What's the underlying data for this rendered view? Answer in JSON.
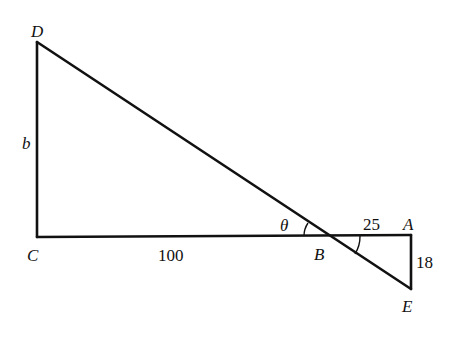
{
  "diagram": {
    "vertices": {
      "D": {
        "label": "D",
        "x": 37,
        "y": 42
      },
      "C": {
        "label": "C",
        "x": 37,
        "y": 237
      },
      "B": {
        "label": "B",
        "x": 327,
        "y": 236
      },
      "A": {
        "label": "A",
        "x": 411,
        "y": 235
      },
      "E": {
        "label": "E",
        "x": 411,
        "y": 289
      }
    },
    "segments": [
      {
        "from": "D",
        "to": "C"
      },
      {
        "from": "C",
        "to": "A"
      },
      {
        "from": "D",
        "to": "E"
      },
      {
        "from": "A",
        "to": "E"
      }
    ],
    "side_labels": {
      "DC": "b",
      "CB": "100",
      "BA": "25",
      "AE": "18"
    },
    "angle_labels": {
      "DBC": "θ"
    },
    "colors": {
      "line": "#111111",
      "background": "#ffffff"
    }
  }
}
